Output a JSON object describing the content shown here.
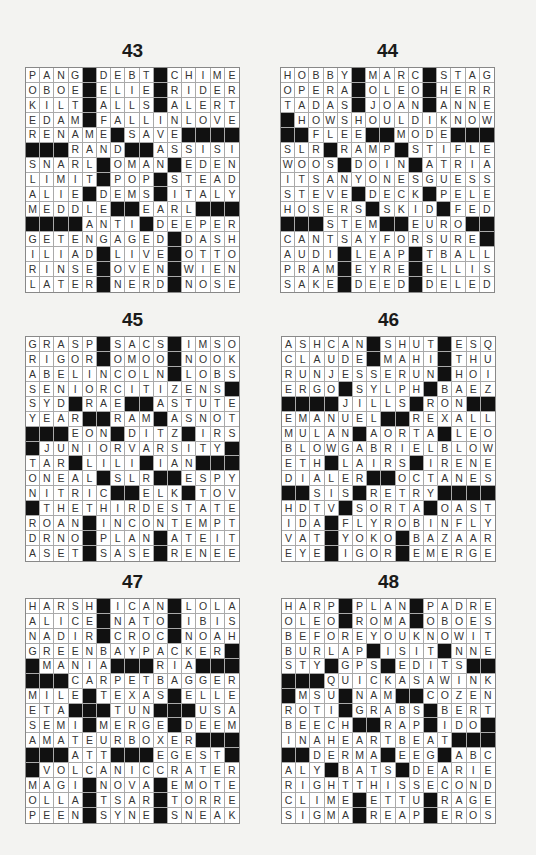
{
  "puzzles": [
    {
      "number": "43",
      "rows": [
        "PANG#DEBT#CHIME",
        "OBOE#ELIE#RIDER",
        "KILT#ALLS#ALERT",
        "EDAM#FALLINLOVE",
        "RENAME#SAVE####",
        "###RAND##ASSISI",
        "SNARL#OMAN#EDEN",
        "LIMIT#POP#STEAD",
        "ALIE#DEMS#ITALY",
        "MEDDLE##EARL###",
        "####ANTI#DEEPER",
        "GETENGAGED#DASH",
        "ILIAD#LIVE#OTTO",
        "RINSE#OVEN#WIEN",
        "LATER#NERD#NOSE"
      ]
    },
    {
      "number": "44",
      "rows": [
        "HOBBY#MARC#STAG",
        "OPERA#OLEO#HERR",
        "TADAS#JOAN#ANNE",
        "#HOWSHOULDIKNOW",
        "##FLEE##MODE###",
        "SLR#RAMP#STIFLE",
        "WOOS#DOIN#ATRIA",
        "ITSANYONESGUESS",
        "STEVE#DECK#PELE",
        "HOSERS#SKID#FED",
        "###STEM##EURO##",
        "CANTSAYFORSURE#",
        "AUDI#LEAP#TBALL",
        "PRAM#EYRE#ELLIS",
        "SAKE#DEED#DELED"
      ]
    },
    {
      "number": "45",
      "rows": [
        "GRASP#SACS#IMSO",
        "RIGOR#OMOO#NOOK",
        "ABELINCOLN#LOBS",
        "SENIORCITIZENS#",
        "SYD#RAE##ASTUTE",
        "YEAR##RAM#ASNOT",
        "###EON#DITZ#IRS",
        "#JUNIORVARSITY#",
        "TAR#LILI#IAN###",
        "ONEAL#SLR##ESPY",
        "NITRIC##ELK#TOV",
        "#THETHIRDESTATE",
        "ROAN#INCONTEMPT",
        "DRNO#PLAN#ATEIT",
        "ASET#SASE#RENEE"
      ]
    },
    {
      "number": "46",
      "rows": [
        "ASHCAN#SHUT#ESQ",
        "CLAUDE#MAHI#THU",
        "RUNJESSERUN#HOI",
        "ERGO#SYLPH#BAEZ",
        "####JILLS#RON##",
        "EMANUEL##REXALL",
        "MULAN#AORTA#LEO",
        "BLOWGABRIELBLOW",
        "ETH#LAIRS#IRENE",
        "DIALER##OCTANES",
        "##SIS#RETRY####",
        "HDTV#SORTA#OAST",
        "IDA#FLYROBINFLY",
        "VAT#YOKO#BAZAAR",
        "EYE#IGOR#EMERGE"
      ]
    },
    {
      "number": "47",
      "rows": [
        "HARSH#ICAN#LOLA",
        "ALICE#NATO#IBIS",
        "NADIR#CROC#NOAH",
        "GREENBAYPACKER#",
        "#MANIA###RIA###",
        "###CARPETBAGGER",
        "MILE#TEXAS#ELLE",
        "ETA###TUN###USA",
        "SEMI#MERGE#DEEM",
        "AMATEURBOXER###",
        "###ATT###EGEST#",
        "#VOLCANICCRATER",
        "MAGI#NOVA#EMOTE",
        "OLLA#TSAR#TORRE",
        "PEEN#SYNE#SNEAK"
      ]
    },
    {
      "number": "48",
      "rows": [
        "HARP#PLAN#PADRE",
        "OLEO#ROMA#OBOES",
        "BEFOREYOUKNOWIT",
        "BURLAP#ISIT#NNE",
        "STY#GPS#EDITS##",
        "###QUICKASAWINK",
        "#MSU#NAM##COZEN",
        "ROTI#GRABS#BERT",
        "BEECH##RAP#IDO#",
        "INAHEARTBEAT###",
        "##DERMA#EEG#ABC",
        "ALY#BATS#DEARIE",
        "RIGHTTHISSECOND",
        "CLIME#ETTU#RAGE",
        "SIGMA#REAP#EROS"
      ]
    }
  ],
  "colors": {
    "background": "#f3f3f1",
    "black_cell": "#111111",
    "white_cell": "#ffffff",
    "letter": "#333333"
  }
}
